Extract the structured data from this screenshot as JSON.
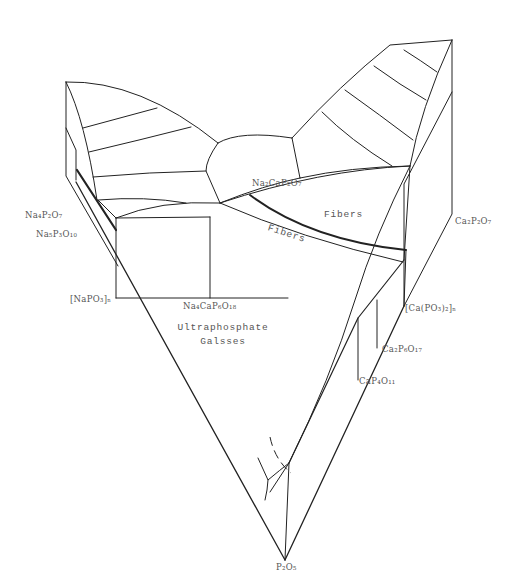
{
  "figure": {
    "type": "ternary-liquidus-projection",
    "stroke_color": "#222222",
    "label_color": "#555555"
  },
  "labels": {
    "na2cap2o7": "Na₂CaP₂O₇",
    "na4p2o7": "Na₄P₂O₇",
    "na5p3o10": "Na₅P₃O₁₀",
    "napo3n": "[NaPO₃]ₙ",
    "na4cap6o18": "Na₄CaP₆O₁₈",
    "ultraphosphate_line1": "Ultraphosphate",
    "ultraphosphate_line2": "Galsses",
    "fibers_large": "Fibers",
    "fibers_small": "Fibers",
    "ca2p2o7": "Ca₂P₂O₇",
    "capo3n": "[Ca(PO₃)₂]ₙ",
    "ca2p6o17": "Ca₂P₆O₁₇",
    "cap4o11": "CaP₄O₁₁",
    "p2o5": "P₂O₅"
  },
  "lines": {
    "thin": [
      "M66,82 L66,175 L118,265 L118,375 L285,560",
      "M66,82 Q82,115 96,190",
      "M66,82 Q150,80 218,143",
      "M83,128 Q120,118 157,108",
      "M89,152 Q140,140 190,128",
      "M94,177 Q150,173 205,171",
      "M98,200 Q145,197 188,203",
      "M218,143 Q205,160 205,171 L219,203",
      "M218,143 Q240,130 267,138",
      "M267,138 Q268,165 271,176",
      "M205,171 L219,203",
      "M219,203 Q270,200 331,201",
      "M98,200 L116,218 L210,217 L210,298",
      "M116,218 Q160,202 219,203",
      "M116,218 L116,298 L288,298",
      "M219,203 Q340,150 410,165",
      "M219,203 Q290,235 401,262",
      "M296,170 L268,150",
      "M396,60 Q360,45 319,60 Q280,80 258,110 L244,140 L219,203",
      "M316,62 Q340,75 374,88",
      "M289,73 Q325,95 360,112",
      "M262,92 Q300,120 342,139",
      "M243,142 Q280,165 319,166",
      "M396,60 Q385,110 370,140 L358,165",
      "M396,60 L405,60 L405,215 L286,505",
      "M396,60 Q390,110 355,165",
      "M404,90 L345,215",
      "M355,165 L355,370 L356,380",
      "M404,91 L404,300",
      "M404,90 L404,215",
      "M355,165 Q320,230 318,320 Q305,400 292,460",
      "M355,170 L330,232",
      "M330,232 L330,330",
      "M357,255 L355,300",
      "M353,220 L289,347 L286,505",
      "M404,95 L404,302",
      "M348,228 L350,280",
      "M288,505 L285,560",
      "M289,349 Q285,395 271,470",
      "M295,438 Q280,455 270,470",
      "M270,470 L258,458",
      "M270,470 L261,490",
      "M353,208 L285,345 L290,350",
      "M357,255 L353,258",
      "M358,255 L359,340",
      "M355,370 L358,295"
    ],
    "thick": [
      "M77,170 L118,226",
      "M111,216 Q170,200 224,203",
      "M214,198 L214,191",
      "M248,198 Q315,255 401,262",
      "M77,170 L118,226"
    ],
    "dashed": [
      "M268,430 Q273,455 286,475"
    ]
  }
}
